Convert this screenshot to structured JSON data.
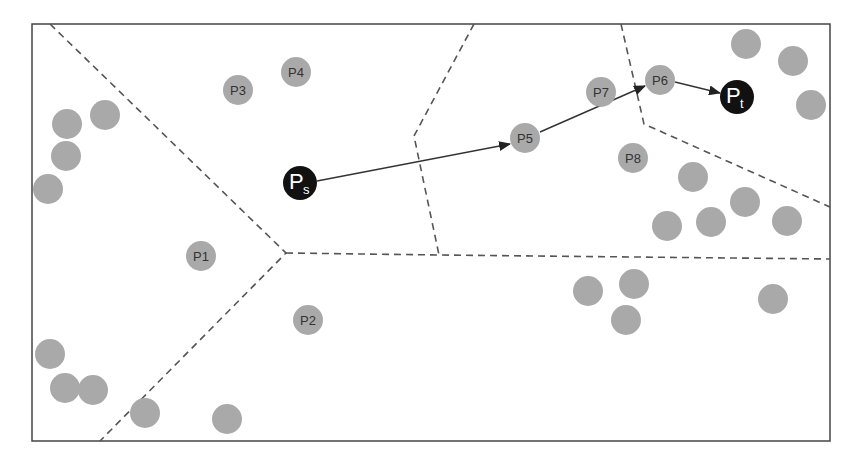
{
  "diagram": {
    "type": "voronoi-path-routing",
    "frame": {
      "x1": 32,
      "y1": 24,
      "x2": 830,
      "y2": 441,
      "stroke": "#444444"
    },
    "colors": {
      "node_fill": "#a9a9a9",
      "node_text": "#333333",
      "endpoint_fill": "#111111",
      "endpoint_text": "#ffffff",
      "dash_stroke": "#555555",
      "path_stroke": "#333333"
    },
    "source": {
      "id": "Ps",
      "label_main": "P",
      "label_sub": "s",
      "x": 300,
      "y": 183,
      "r": 17
    },
    "target": {
      "id": "Pt",
      "label_main": "P",
      "label_sub": "t",
      "x": 737,
      "y": 97,
      "r": 17
    },
    "labeled_nodes": [
      {
        "id": "P1",
        "label": "P1",
        "x": 201,
        "y": 256
      },
      {
        "id": "P2",
        "label": "P2",
        "x": 308,
        "y": 320
      },
      {
        "id": "P3",
        "label": "P3",
        "x": 238,
        "y": 90
      },
      {
        "id": "P4",
        "label": "P4",
        "x": 296,
        "y": 72
      },
      {
        "id": "P5",
        "label": "P5",
        "x": 525,
        "y": 138
      },
      {
        "id": "P6",
        "label": "P6",
        "x": 660,
        "y": 80
      },
      {
        "id": "P7",
        "label": "P7",
        "x": 601,
        "y": 92
      },
      {
        "id": "P8",
        "label": "P8",
        "x": 633,
        "y": 158
      }
    ],
    "unlabeled_nodes": [
      {
        "x": 67,
        "y": 124
      },
      {
        "x": 105,
        "y": 115
      },
      {
        "x": 66,
        "y": 156
      },
      {
        "x": 48,
        "y": 189
      },
      {
        "x": 50,
        "y": 354
      },
      {
        "x": 65,
        "y": 388
      },
      {
        "x": 93,
        "y": 390
      },
      {
        "x": 145,
        "y": 413
      },
      {
        "x": 227,
        "y": 419
      },
      {
        "x": 746,
        "y": 44
      },
      {
        "x": 793,
        "y": 61
      },
      {
        "x": 811,
        "y": 105
      },
      {
        "x": 693,
        "y": 177
      },
      {
        "x": 667,
        "y": 226
      },
      {
        "x": 711,
        "y": 222
      },
      {
        "x": 745,
        "y": 202
      },
      {
        "x": 787,
        "y": 221
      },
      {
        "x": 588,
        "y": 291
      },
      {
        "x": 634,
        "y": 284
      },
      {
        "x": 626,
        "y": 320
      },
      {
        "x": 773,
        "y": 299
      }
    ],
    "node_radius": 15,
    "boundaries": [
      {
        "points": "50,24 286,253 100,441"
      },
      {
        "points": "286,253 439,255 830,259"
      },
      {
        "points": "474,24 414,136 439,255"
      },
      {
        "points": "621,24 644,124 830,207"
      }
    ],
    "path_edges": [
      {
        "from": "Ps",
        "x1": 317,
        "y1": 181,
        "x2": 510,
        "y2": 144
      },
      {
        "from": "P5",
        "x1": 540,
        "y1": 132,
        "x2": 645,
        "y2": 86
      },
      {
        "from": "P6",
        "x1": 675,
        "y1": 82,
        "x2": 720,
        "y2": 93
      }
    ],
    "path_order": [
      "Ps",
      "P5",
      "P6",
      "Pt"
    ]
  }
}
